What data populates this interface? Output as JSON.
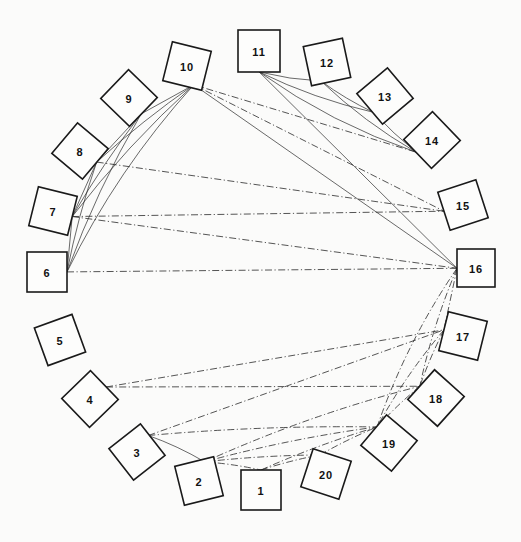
{
  "figure": {
    "type": "node-link-diagram",
    "layout": "circular",
    "background_color": "#fbfbfa",
    "line_color": "#2a2a2a",
    "node_fill": "#fdfdfc",
    "node_stroke": "#1a1a1a",
    "width": 521,
    "height": 542
  },
  "nodes": [
    {
      "id": 1,
      "label": "1",
      "cx": 261,
      "cy": 490,
      "size": 40,
      "rotation": 0
    },
    {
      "id": 2,
      "label": "2",
      "cx": 199,
      "cy": 481,
      "size": 40,
      "rotation": -14
    },
    {
      "id": 3,
      "label": "3",
      "cx": 137,
      "cy": 452,
      "size": 40,
      "rotation": -38
    },
    {
      "id": 4,
      "label": "4",
      "cx": 90,
      "cy": 399,
      "size": 40,
      "rotation": -44
    },
    {
      "id": 5,
      "label": "5",
      "cx": 60,
      "cy": 340,
      "size": 40,
      "rotation": -20
    },
    {
      "id": 6,
      "label": "6",
      "cx": 47,
      "cy": 272,
      "size": 40,
      "rotation": 0
    },
    {
      "id": 7,
      "label": "7",
      "cx": 53,
      "cy": 211,
      "size": 40,
      "rotation": 14
    },
    {
      "id": 8,
      "label": "8",
      "cx": 80,
      "cy": 151,
      "size": 40,
      "rotation": 40
    },
    {
      "id": 9,
      "label": "9",
      "cx": 129,
      "cy": 98,
      "size": 40,
      "rotation": 44
    },
    {
      "id": 10,
      "label": "10",
      "cx": 187,
      "cy": 66,
      "size": 40,
      "rotation": 14
    },
    {
      "id": 11,
      "label": "11",
      "cx": 259,
      "cy": 51,
      "size": 42,
      "rotation": 0
    },
    {
      "id": 12,
      "label": "12",
      "cx": 327,
      "cy": 62,
      "size": 40,
      "rotation": -12
    },
    {
      "id": 13,
      "label": "13",
      "cx": 385,
      "cy": 96,
      "size": 40,
      "rotation": -40
    },
    {
      "id": 14,
      "label": "14",
      "cx": 432,
      "cy": 140,
      "size": 40,
      "rotation": -44
    },
    {
      "id": 15,
      "label": "15",
      "cx": 463,
      "cy": 205,
      "size": 40,
      "rotation": -18
    },
    {
      "id": 16,
      "label": "16",
      "cx": 476,
      "cy": 268,
      "size": 38,
      "rotation": 0
    },
    {
      "id": 17,
      "label": "17",
      "cx": 463,
      "cy": 336,
      "size": 40,
      "rotation": 14
    },
    {
      "id": 18,
      "label": "18",
      "cx": 436,
      "cy": 398,
      "size": 40,
      "rotation": 42
    },
    {
      "id": 19,
      "label": "19",
      "cx": 389,
      "cy": 443,
      "size": 40,
      "rotation": 40
    },
    {
      "id": 20,
      "label": "20",
      "cx": 326,
      "cy": 474,
      "size": 40,
      "rotation": 18
    }
  ],
  "edges": [
    {
      "from": 6,
      "to": 7,
      "style": "solid",
      "bow": 0
    },
    {
      "from": 6,
      "to": 8,
      "style": "solid",
      "bow": 4
    },
    {
      "from": 6,
      "to": 9,
      "style": "solid",
      "bow": 8
    },
    {
      "from": 6,
      "to": 10,
      "style": "solid",
      "bow": 16
    },
    {
      "from": 7,
      "to": 8,
      "style": "solid",
      "bow": 0
    },
    {
      "from": 7,
      "to": 9,
      "style": "solid",
      "bow": 4
    },
    {
      "from": 7,
      "to": 10,
      "style": "solid",
      "bow": 8
    },
    {
      "from": 8,
      "to": 9,
      "style": "solid",
      "bow": 0
    },
    {
      "from": 8,
      "to": 10,
      "style": "solid",
      "bow": 4
    },
    {
      "from": 9,
      "to": 10,
      "style": "solid",
      "bow": 0
    },
    {
      "from": 11,
      "to": 12,
      "style": "solid",
      "bow": -3
    },
    {
      "from": 11,
      "to": 13,
      "style": "solid",
      "bow": -7
    },
    {
      "from": 11,
      "to": 14,
      "style": "solid",
      "bow": -13
    },
    {
      "from": 12,
      "to": 13,
      "style": "solid",
      "bow": -3
    },
    {
      "from": 12,
      "to": 14,
      "style": "solid",
      "bow": -7
    },
    {
      "from": 13,
      "to": 14,
      "style": "solid",
      "bow": -2
    },
    {
      "from": 10,
      "to": 15,
      "style": "dashdot",
      "bow": 0
    },
    {
      "from": 10,
      "to": 16,
      "style": "solid",
      "bow": 0
    },
    {
      "from": 10,
      "to": 14,
      "style": "dashdot",
      "bow": 0
    },
    {
      "from": 11,
      "to": 16,
      "style": "solid",
      "bow": 0
    },
    {
      "from": 8,
      "to": 15,
      "style": "dashdot",
      "bow": 0
    },
    {
      "from": 7,
      "to": 15,
      "style": "dashdot",
      "bow": 0
    },
    {
      "from": 7,
      "to": 16,
      "style": "dashdot",
      "bow": 0
    },
    {
      "from": 6,
      "to": 16,
      "style": "dashdot",
      "bow": 0
    },
    {
      "from": 4,
      "to": 17,
      "style": "dashdot",
      "bow": 0
    },
    {
      "from": 4,
      "to": 18,
      "style": "dashdot",
      "bow": 0
    },
    {
      "from": 3,
      "to": 17,
      "style": "dashdot",
      "bow": 0
    },
    {
      "from": 3,
      "to": 19,
      "style": "dashdot",
      "bow": -6
    },
    {
      "from": 2,
      "to": 19,
      "style": "dashdot",
      "bow": -6
    },
    {
      "from": 2,
      "to": 18,
      "style": "dashdot",
      "bow": -10
    },
    {
      "from": 1,
      "to": 19,
      "style": "dashdot",
      "bow": -4
    },
    {
      "from": 16,
      "to": 17,
      "style": "dashdot",
      "bow": 0
    },
    {
      "from": 16,
      "to": 18,
      "style": "dashdot",
      "bow": -6
    },
    {
      "from": 16,
      "to": 19,
      "style": "dashdot",
      "bow": -12
    },
    {
      "from": 17,
      "to": 18,
      "style": "dashdot",
      "bow": -2
    },
    {
      "from": 17,
      "to": 19,
      "style": "dashdot",
      "bow": -6
    },
    {
      "from": 18,
      "to": 19,
      "style": "dashdot",
      "bow": -2
    },
    {
      "from": 2,
      "to": 20,
      "style": "dashdot",
      "bow": -3
    },
    {
      "from": 1,
      "to": 20,
      "style": "dashdot",
      "bow": -2
    },
    {
      "from": 20,
      "to": 19,
      "style": "dashdot",
      "bow": -2
    },
    {
      "from": 2,
      "to": 1,
      "style": "dashdot",
      "bow": -2
    },
    {
      "from": 3,
      "to": 2,
      "style": "solid",
      "bow": -3
    }
  ]
}
